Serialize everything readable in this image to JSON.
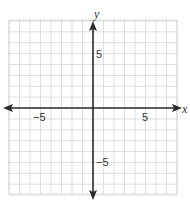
{
  "chart_data": {
    "type": "coordinate-grid",
    "title": "",
    "xlabel": "x",
    "ylabel": "y",
    "xlim": [
      -8,
      8
    ],
    "ylim": [
      -8,
      8
    ],
    "grid": true,
    "grid_step": 1,
    "tick_labels": {
      "x": [
        {
          "value": -5,
          "label": "−5"
        },
        {
          "value": 5,
          "label": "5"
        }
      ],
      "y": [
        {
          "value": 5,
          "label": "5"
        },
        {
          "value": -5,
          "label": "−5"
        }
      ]
    },
    "series": []
  },
  "colors": {
    "grid": "#cfcfcf",
    "axis": "#2a2a2a",
    "background": "#ffffff"
  }
}
